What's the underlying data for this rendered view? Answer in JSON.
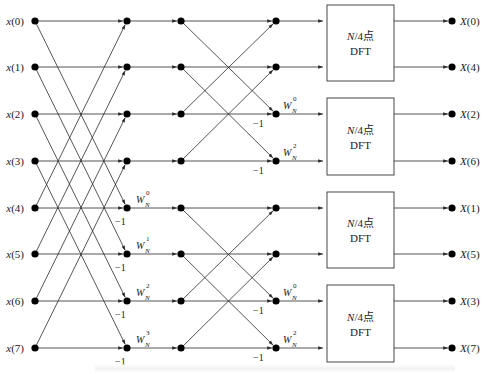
{
  "colors": {
    "line": "#2a2a2a",
    "node": "#000000",
    "box_stroke": "#333333",
    "background": "#ffffff"
  },
  "rows_y": [
    21,
    67,
    114,
    161,
    208,
    254,
    301,
    348
  ],
  "columns_x": [
    35,
    127,
    181,
    276,
    452
  ],
  "inputs": [
    "x(0)",
    "x(1)",
    "x(2)",
    "x(3)",
    "x(4)",
    "x(5)",
    "x(6)",
    "x(7)"
  ],
  "outputs": [
    "X(0)",
    "X(4)",
    "X(2)",
    "X(6)",
    "X(1)",
    "X(5)",
    "X(3)",
    "X(7)"
  ],
  "stage1": {
    "pairs": [
      [
        0,
        4
      ],
      [
        1,
        5
      ],
      [
        2,
        6
      ],
      [
        3,
        7
      ]
    ],
    "twiddles": [
      {
        "row": 4,
        "base": "W",
        "sub": "N",
        "sup": "0"
      },
      {
        "row": 5,
        "base": "W",
        "sub": "N",
        "sup": "1"
      },
      {
        "row": 6,
        "base": "W",
        "sub": "N",
        "sup": "2"
      },
      {
        "row": 7,
        "base": "W",
        "sub": "N",
        "sup": "3"
      }
    ],
    "minus_label": "−1"
  },
  "stage2": {
    "pairs": [
      [
        0,
        2
      ],
      [
        1,
        3
      ],
      [
        4,
        6
      ],
      [
        5,
        7
      ]
    ],
    "twiddles": [
      {
        "row": 2,
        "base": "W",
        "sub": "N",
        "sup": "0"
      },
      {
        "row": 3,
        "base": "W",
        "sub": "N",
        "sup": "2"
      },
      {
        "row": 6,
        "base": "W",
        "sub": "N",
        "sup": "0"
      },
      {
        "row": 7,
        "base": "W",
        "sub": "N",
        "sup": "2"
      }
    ],
    "minus_label": "−1"
  },
  "dft_boxes": [
    {
      "line1": "N/4点",
      "line2": "DFT",
      "rows": [
        0,
        1
      ]
    },
    {
      "line1": "N/4点",
      "line2": "DFT",
      "rows": [
        2,
        3
      ]
    },
    {
      "line1": "N/4点",
      "line2": "DFT",
      "rows": [
        4,
        5
      ]
    },
    {
      "line1": "N/4点",
      "line2": "DFT",
      "rows": [
        6,
        7
      ]
    }
  ]
}
